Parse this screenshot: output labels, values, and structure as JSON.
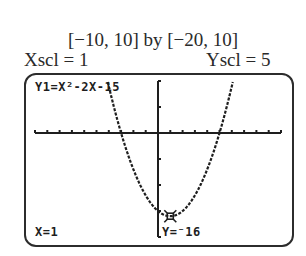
{
  "caption": {
    "window": "[−10, 10] by [−20, 10]",
    "xscl": "Xscl = 1",
    "yscl": "Yscl = 5"
  },
  "screen": {
    "equation": "Y1=X²-2X-15",
    "trace_x": "X=1",
    "trace_y": "Y=⁻16"
  },
  "chart_data": {
    "type": "line",
    "title": "Y1=X²-2X-15",
    "function": "x^2 - 2x - 15",
    "xlim": [
      -10,
      10
    ],
    "ylim": [
      -20,
      10
    ],
    "xscl": 1,
    "yscl": 5,
    "grid": false,
    "x_intercepts": [
      -3,
      5
    ],
    "y_intercept": -15,
    "vertex": {
      "x": 1,
      "y": -16
    },
    "trace_cursor": {
      "x": 1,
      "y": -16
    },
    "series": [
      {
        "name": "Y1",
        "x": [
          -5,
          -4,
          -3,
          -2,
          -1,
          0,
          1,
          2,
          3,
          4,
          5,
          6,
          7
        ],
        "values": [
          20,
          9,
          0,
          -7,
          -12,
          -15,
          -16,
          -15,
          -12,
          -7,
          0,
          9,
          20
        ]
      }
    ]
  }
}
